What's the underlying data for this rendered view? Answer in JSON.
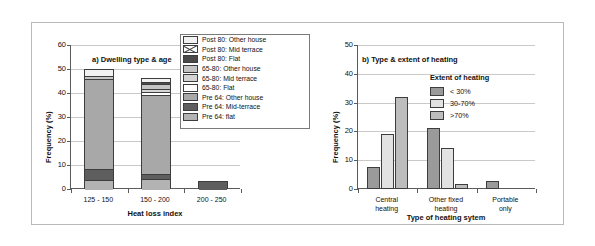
{
  "figure": {
    "background": "#ffffff",
    "border_color": "#b9b9b9"
  },
  "chart_data": [
    {
      "type": "bar",
      "subtype": "stacked",
      "title": "a) Dwelling type & age",
      "xlabel": "Heat loss index",
      "ylabel": "Frequency (%)",
      "categories": [
        "125 - 150",
        "150 - 200",
        "200 - 250"
      ],
      "ylim": [
        0,
        60
      ],
      "yticks": [
        0,
        10,
        20,
        30,
        40,
        50,
        60
      ],
      "grid": true,
      "legend_position": "top-right",
      "legend_title": "",
      "series": [
        {
          "name": "Pre 64: flat",
          "values": [
            4.0,
            4.6,
            0.0
          ],
          "color": "#b3b3b3",
          "pattern": "solid"
        },
        {
          "name": "Pre 64: Mid-terrace",
          "values": [
            4.7,
            2.2,
            3.3
          ],
          "color": "#5e5e5e",
          "pattern": "solid"
        },
        {
          "name": "Pre 64: Other house",
          "values": [
            37.6,
            32.9,
            0.0
          ],
          "color": "#a8a8a8",
          "pattern": "solid"
        },
        {
          "name": "65-80: Flat",
          "values": [
            0.0,
            1.2,
            0.0
          ],
          "color": "#ffffff",
          "pattern": "solid"
        },
        {
          "name": "65-80: Mid terrace",
          "values": [
            0.0,
            1.1,
            0.0
          ],
          "color": "#d4d4d4",
          "pattern": "solid"
        },
        {
          "name": "65-80: Other house",
          "values": [
            1.2,
            2.1,
            0.0
          ],
          "color": "#c4c4c4",
          "pattern": "solid"
        },
        {
          "name": "Post 80: Flat",
          "values": [
            0.0,
            1.0,
            0.0
          ],
          "color": "#4a4a4a",
          "pattern": "solid"
        },
        {
          "name": "Post 80: Mid terrace",
          "values": [
            0.0,
            0.0,
            0.0
          ],
          "color": "#ffffff",
          "pattern": "cross"
        },
        {
          "name": "Post 80: Other house",
          "values": [
            2.5,
            1.2,
            0.0
          ],
          "color": "#f2f2f2",
          "pattern": "solid"
        }
      ],
      "legend_order": [
        "Post 80: Other house",
        "Post 80: Mid terrace",
        "Post 80: Flat",
        "65-80: Other house",
        "65-80: Mid terrace",
        "65-80: Flat",
        "Pre 64: Other house",
        "Pre 64: Mid-terrace",
        "Pre 64: flat"
      ],
      "totals": [
        50.0,
        46.3,
        3.3
      ]
    },
    {
      "type": "bar",
      "subtype": "grouped",
      "title": "b) Type & extent of heating",
      "xlabel": "Type of heating sytem",
      "ylabel": "Frequency (%)",
      "categories": [
        "Central heating",
        "Other fixed heating",
        "Portable only"
      ],
      "category_lines": [
        [
          "Central",
          "heating"
        ],
        [
          "Other fixed",
          "heating"
        ],
        [
          "Portable",
          "only"
        ]
      ],
      "ylim": [
        0,
        50
      ],
      "yticks": [
        0,
        10,
        20,
        30,
        40,
        50
      ],
      "grid": true,
      "legend_title": "Extent of heating",
      "legend_position": "upper-right",
      "series": [
        {
          "name": "< 30%",
          "values": [
            7.5,
            21.3,
            2.7
          ],
          "color": "#9a9a9a"
        },
        {
          "name": "30-70%",
          "values": [
            19.2,
            14.4,
            0.0
          ],
          "color": "#e2e2e2"
        },
        {
          "name": ">70%",
          "values": [
            32.1,
            1.9,
            0.0
          ],
          "color": "#bdbdbd"
        }
      ]
    }
  ]
}
